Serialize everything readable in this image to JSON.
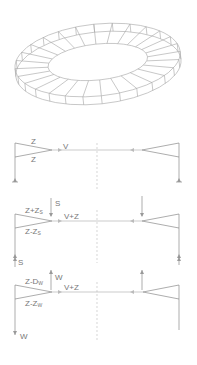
{
  "ring": {
    "description": "3D wireframe of elliptical ring roof structure",
    "segments": 28,
    "stroke": "#9a9a9a"
  },
  "diagrams": [
    {
      "id": "base",
      "labels": {
        "top_chord": "Z",
        "bottom_chord": "Z",
        "tension": "V"
      }
    },
    {
      "id": "snow",
      "labels": {
        "load": "S",
        "top_chord": "Z+Z",
        "top_chord_sub": "S",
        "bottom_chord": "Z-Z",
        "bottom_chord_sub": "S",
        "tension": "V+Z",
        "reaction": "S"
      }
    },
    {
      "id": "wind",
      "labels": {
        "load": "W",
        "top_chord": "Z-D",
        "top_chord_sub": "W",
        "bottom_chord": "Z-Z",
        "bottom_chord_sub": "W",
        "tension": "V+Z",
        "reaction": "W"
      }
    }
  ],
  "colors": {
    "line": "#8a8a8a",
    "centerline": "#bdbdbd",
    "text": "#777777"
  }
}
